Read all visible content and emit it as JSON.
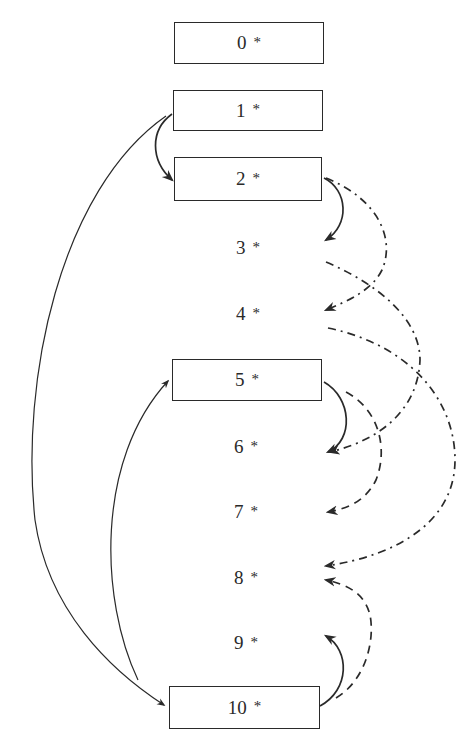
{
  "diagram": {
    "nodes": [
      {
        "id": "0",
        "label": "0",
        "marker": "*",
        "boxed": true
      },
      {
        "id": "1",
        "label": "1",
        "marker": "*",
        "boxed": true
      },
      {
        "id": "2",
        "label": "2",
        "marker": "*",
        "boxed": true
      },
      {
        "id": "3",
        "label": "3",
        "marker": "*",
        "boxed": false
      },
      {
        "id": "4",
        "label": "4",
        "marker": "*",
        "boxed": false
      },
      {
        "id": "5",
        "label": "5",
        "marker": "*",
        "boxed": true
      },
      {
        "id": "6",
        "label": "6",
        "marker": "*",
        "boxed": false
      },
      {
        "id": "7",
        "label": "7",
        "marker": "*",
        "boxed": false
      },
      {
        "id": "8",
        "label": "8",
        "marker": "*",
        "boxed": false
      },
      {
        "id": "9",
        "label": "9",
        "marker": "*",
        "boxed": false
      },
      {
        "id": "10",
        "label": "10",
        "marker": "*",
        "boxed": true
      }
    ],
    "edges": [
      {
        "from": "1",
        "to": "2",
        "style": "solid",
        "side": "left"
      },
      {
        "from": "1",
        "to": "10",
        "style": "solid-thin",
        "side": "left"
      },
      {
        "from": "10",
        "to": "5",
        "style": "solid-thin",
        "side": "left"
      },
      {
        "from": "2",
        "to": "3",
        "style": "solid",
        "side": "right"
      },
      {
        "from": "2",
        "to": "4",
        "style": "dash-dot",
        "side": "right"
      },
      {
        "from": "3",
        "to": "6",
        "style": "dash-dot",
        "side": "right"
      },
      {
        "from": "4",
        "to": "8",
        "style": "dash-dot",
        "side": "right"
      },
      {
        "from": "5",
        "to": "6",
        "style": "solid",
        "side": "right"
      },
      {
        "from": "5",
        "to": "7",
        "style": "dashed",
        "side": "right"
      },
      {
        "from": "10",
        "to": "9",
        "style": "solid",
        "side": "right"
      },
      {
        "from": "10",
        "to": "8",
        "style": "dashed",
        "side": "right"
      }
    ],
    "colors": {
      "line": "#2a2a2a",
      "background": "#ffffff"
    }
  }
}
